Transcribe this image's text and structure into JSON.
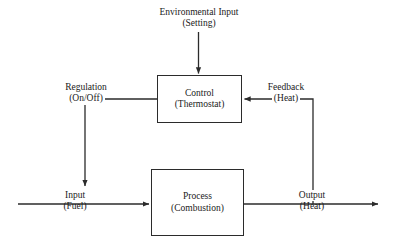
{
  "diagram": {
    "background_color": "#ffffff",
    "line_color": "#2b2b2b",
    "text_color": "#1a1a1a",
    "nodes": [
      {
        "id": "control",
        "primary": "Control",
        "secondary": "(Thermostat)"
      },
      {
        "id": "process",
        "primary": "Process",
        "secondary": "(Combustion)"
      }
    ],
    "edge_labels": [
      {
        "id": "environmental",
        "primary": "Environmental Input",
        "secondary": "(Setting)"
      },
      {
        "id": "regulation",
        "primary": "Regulation",
        "secondary": "(On/Off)"
      },
      {
        "id": "feedback",
        "primary": "Feedback",
        "secondary": "(Heat)"
      },
      {
        "id": "input",
        "primary": "Input",
        "secondary": "(Fuel)"
      },
      {
        "id": "output",
        "primary": "Output",
        "secondary": "(Heat)"
      }
    ]
  }
}
